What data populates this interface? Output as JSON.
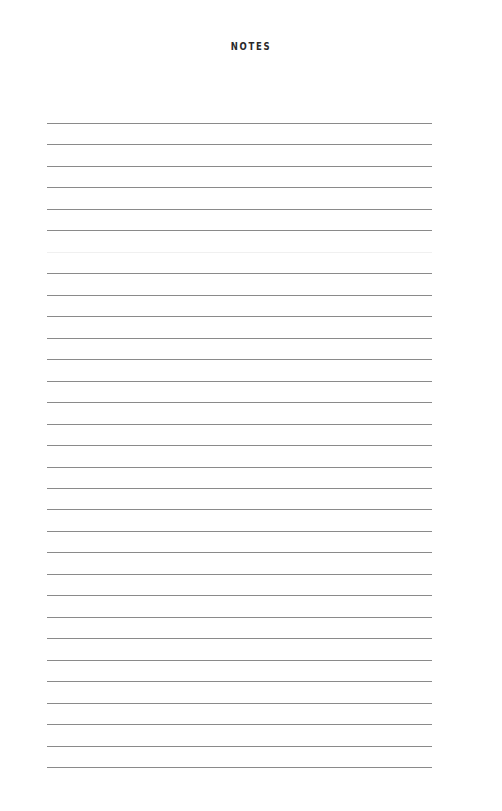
{
  "page": {
    "title": "NOTES",
    "line_count": 31,
    "line_start_y": 123,
    "line_spacing": 21.47,
    "faint_line_indices": [
      6
    ],
    "line_color": "#8a8a8a"
  }
}
